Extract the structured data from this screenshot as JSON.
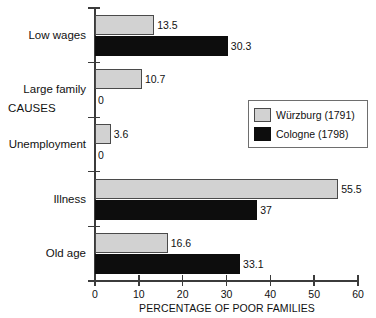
{
  "chart_data": {
    "type": "bar",
    "orientation": "horizontal",
    "title": "",
    "xlabel": "PERCENTAGE OF POOR FAMILIES",
    "ylabel": "CAUSES",
    "categories": [
      "Low wages",
      "Large family",
      "Unemployment",
      "Illness",
      "Old age"
    ],
    "series": [
      {
        "name": "Würzburg (1791)",
        "color": "#d2d2d2",
        "values": [
          13.5,
          10.7,
          3.6,
          55.5,
          16.6
        ],
        "labels": [
          "13.5",
          "10.7",
          "3.6",
          "55.5",
          "16.6"
        ]
      },
      {
        "name": "Cologne (1798)",
        "color": "#0d0d0d",
        "values": [
          30.3,
          0,
          0,
          37,
          33.1
        ],
        "labels": [
          "30.3",
          "0",
          "0",
          "37",
          "33.1"
        ]
      }
    ],
    "xlim": [
      0,
      60
    ],
    "xticks": [
      0,
      10,
      20,
      30,
      40,
      50,
      60
    ],
    "xtick_labels": [
      "0",
      "10",
      "20",
      "30",
      "40",
      "50",
      "60"
    ],
    "grid": false,
    "legend_position": "center-right"
  },
  "legend": {
    "entries": [
      {
        "label": "Würzburg (1791)",
        "swatch": "wurzburg-swatch"
      },
      {
        "label": "Cologne (1798)",
        "swatch": "cologne-swatch"
      }
    ]
  }
}
